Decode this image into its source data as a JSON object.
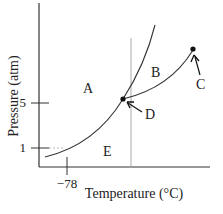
{
  "diagram": {
    "type": "phase-diagram",
    "xlabel": "Temperature (°C)",
    "ylabel": "Pressure (atm)",
    "x_ticks": [
      {
        "label": "−78",
        "value": -78
      }
    ],
    "y_ticks": [
      {
        "label": "5",
        "value": 5
      },
      {
        "label": "1",
        "value": 1
      }
    ],
    "regions": [
      {
        "id": "A",
        "label": "A"
      },
      {
        "id": "B",
        "label": "B"
      },
      {
        "id": "E",
        "label": "E"
      }
    ],
    "points": [
      {
        "id": "C",
        "label": "C"
      },
      {
        "id": "D",
        "label": "D"
      }
    ],
    "colors": {
      "line": "#333333",
      "guide": "#aaaaaa",
      "text": "#222222"
    }
  }
}
